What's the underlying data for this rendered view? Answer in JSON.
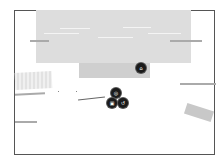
{
  "scene": {
    "markers": [
      {
        "id": "marker-top",
        "glyph": "⌂"
      },
      {
        "id": "marker-a",
        "glyph": "◎"
      },
      {
        "id": "marker-b",
        "glyph": "▣"
      },
      {
        "id": "marker-c",
        "glyph": "↺"
      }
    ]
  },
  "colors": {
    "frame": "#555555",
    "block": "#dddddd",
    "marker": "#1b1b1b"
  }
}
